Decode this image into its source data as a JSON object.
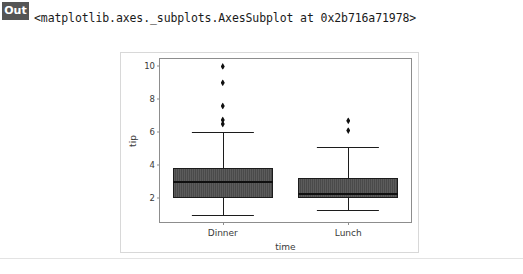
{
  "cell": {
    "prompt_label": "Out",
    "repr_text": "<matplotlib.axes._subplots.AxesSubplot at 0x2b716a71978>"
  },
  "chart_data": {
    "type": "box",
    "title": "",
    "xlabel": "time",
    "ylabel": "tip",
    "categories": [
      "Dinner",
      "Lunch"
    ],
    "ylim": [
      0.55,
      10.45
    ],
    "yticks": [
      2,
      4,
      6,
      8,
      10
    ],
    "ytick_labels": [
      "2",
      "4",
      "6",
      "8",
      "10"
    ],
    "grid": false,
    "legend": null,
    "box_color": "#4a4a4a",
    "line_color": "#1c1c1c",
    "boxes": [
      {
        "label": "Dinner",
        "q1": 2.0,
        "median": 3.0,
        "q3": 3.8,
        "whisker_low": 1.0,
        "whisker_high": 6.0,
        "fliers": [
          6.5,
          6.75,
          7.6,
          9.0,
          10.0
        ]
      },
      {
        "label": "Lunch",
        "q1": 2.0,
        "median": 2.25,
        "q3": 3.25,
        "whisker_low": 1.25,
        "whisker_high": 5.1,
        "fliers": [
          6.1,
          6.7
        ]
      }
    ]
  }
}
